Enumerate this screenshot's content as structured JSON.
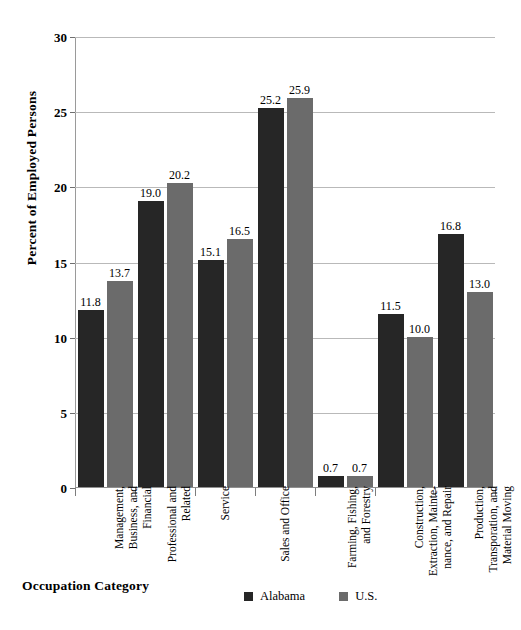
{
  "chart_data": {
    "type": "bar",
    "title": "",
    "xlabel": "Occupation Category",
    "ylabel": "Percent of Employed Persons",
    "ylim": [
      0,
      30
    ],
    "ytick_values": [
      0,
      5,
      10,
      15,
      20,
      25,
      30
    ],
    "ytick_labels": [
      "0",
      "5",
      "10",
      "15",
      "20",
      "25",
      "30"
    ],
    "grid": true,
    "legend_position": "bottom",
    "categories": [
      "Management, Business, and Financial",
      "Professional and Related",
      "Service",
      "Sales and Office",
      "Farming, Fishing, and Forestry",
      "Construction, Extraction, Maintenance, and Repair",
      "Production, Transporation, and Material Moving"
    ],
    "category_labels_wrapped": [
      "Management,\nBusiness, and\nFinancial",
      "Professional and\nRelated",
      "Service",
      "Sales and Office",
      "Farming, Fishing,\nand Forestry",
      "Construction,\nExtraction, Mainte-\nnance, and Repair",
      "Production,\nTransporation, and\nMaterial Moving"
    ],
    "series": [
      {
        "name": "Alabama",
        "color": "#262626",
        "values": [
          11.8,
          19.0,
          15.1,
          25.2,
          0.7,
          11.5,
          16.8
        ],
        "value_labels": [
          "11.8",
          "19.0",
          "15.1",
          "25.2",
          "0.7",
          "11.5",
          "16.8"
        ]
      },
      {
        "name": "U.S.",
        "color": "#6b6b6b",
        "values": [
          13.7,
          20.2,
          16.5,
          25.9,
          0.7,
          10.0,
          13.0
        ],
        "value_labels": [
          "13.7",
          "20.2",
          "16.5",
          "25.9",
          "0.7",
          "10.0",
          "13.0"
        ]
      }
    ]
  },
  "legend": {
    "items": [
      {
        "label": "Alabama",
        "color": "#262626"
      },
      {
        "label": "U.S.",
        "color": "#6b6b6b"
      }
    ]
  },
  "axes": {
    "y_title": "Percent of Employed Persons",
    "x_title": "Occupation Category"
  },
  "colors": {
    "alabama": "#262626",
    "us": "#6b6b6b",
    "gridline": "#b9b9b9",
    "axis": "#8f8f8f",
    "background": "#ffffff"
  }
}
